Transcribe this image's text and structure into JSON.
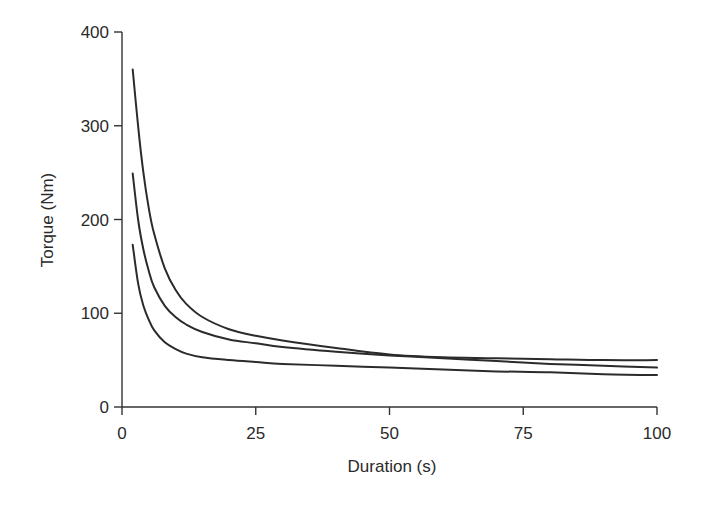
{
  "chart_data": {
    "type": "line",
    "title": "",
    "xlabel": "Duration (s)",
    "ylabel": "Torque (Nm)",
    "xlim": [
      0,
      100
    ],
    "ylim": [
      0,
      400
    ],
    "xticks": [
      0,
      25,
      50,
      75,
      100
    ],
    "yticks": [
      0,
      100,
      200,
      300,
      400
    ],
    "grid": false,
    "legend": null,
    "series": [
      {
        "name": "curve-upper",
        "x": [
          2,
          3,
          4,
          5,
          6,
          8,
          10,
          12,
          15,
          20,
          25,
          30,
          40,
          50,
          60,
          70,
          80,
          90,
          100
        ],
        "y": [
          360,
          300,
          250,
          212,
          185,
          148,
          125,
          110,
          96,
          83,
          76,
          71,
          63,
          56,
          53,
          52,
          51,
          50,
          50
        ]
      },
      {
        "name": "curve-middle",
        "x": [
          2,
          3,
          4,
          5,
          6,
          8,
          10,
          12,
          15,
          20,
          25,
          30,
          40,
          50,
          60,
          70,
          80,
          90,
          100
        ],
        "y": [
          249,
          200,
          168,
          145,
          128,
          108,
          96,
          88,
          80,
          72,
          68,
          64,
          59,
          55,
          52,
          49,
          46,
          44,
          42
        ]
      },
      {
        "name": "curve-lower",
        "x": [
          2,
          3,
          4,
          5,
          6,
          8,
          10,
          12,
          15,
          20,
          25,
          30,
          40,
          50,
          60,
          70,
          80,
          90,
          100
        ],
        "y": [
          173,
          132,
          108,
          93,
          82,
          69,
          62,
          57,
          53,
          50,
          48,
          46,
          44,
          42,
          40,
          38,
          37,
          35,
          34
        ]
      }
    ]
  },
  "axes": {
    "x_title": "Duration (s)",
    "y_title": "Torque (Nm)",
    "x_tick_labels": [
      "0",
      "25",
      "50",
      "75",
      "100"
    ],
    "y_tick_labels": [
      "0",
      "100",
      "200",
      "300",
      "400"
    ]
  }
}
